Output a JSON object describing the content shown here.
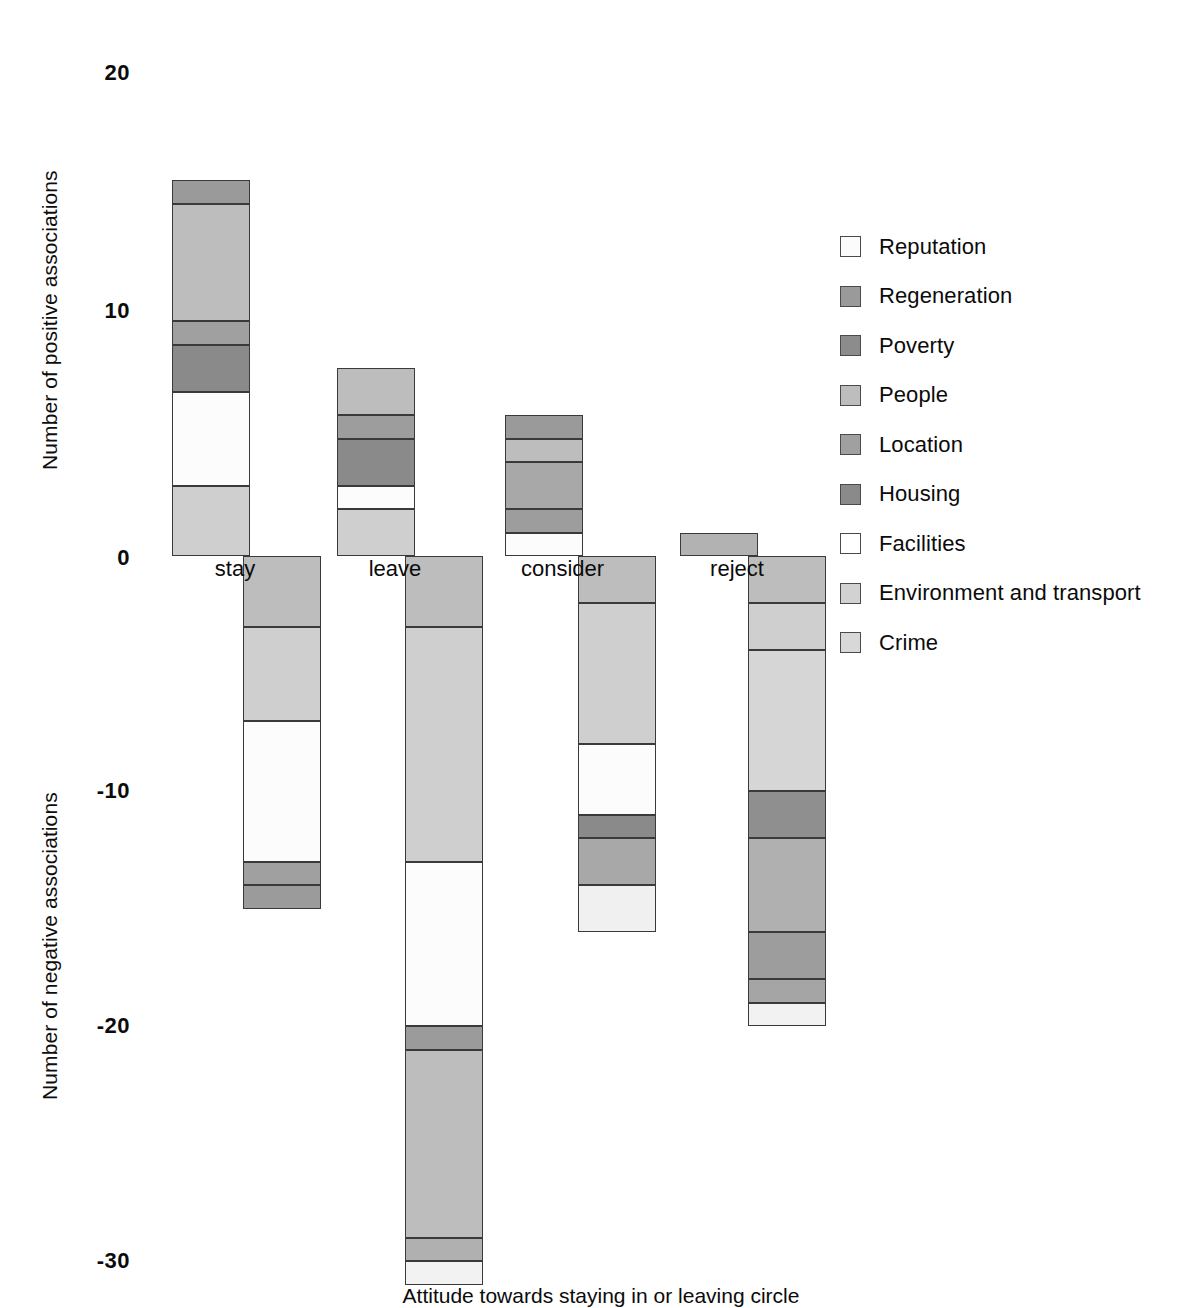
{
  "chart_data": {
    "type": "bar",
    "subtype": "stacked-diverging",
    "title": "",
    "xlabel": "Attitude towards staying in or leaving circle",
    "ylabel_positive": "Number of positive associations",
    "ylabel_negative": "Number of negative associations",
    "categories": [
      "stay",
      "leave",
      "consider",
      "reject"
    ],
    "ylim": [
      -30,
      20
    ],
    "yticks": [
      20,
      10,
      0,
      -10,
      -20,
      -30
    ],
    "ytick_labels": [
      "20",
      "10",
      "0",
      "-10",
      "-20",
      "-30"
    ],
    "grid": false,
    "legend_position": "right",
    "series": [
      {
        "name": "Reputation",
        "color": "#fbfbfb",
        "positive": [
          0,
          0,
          0,
          0
        ],
        "negative": [
          0,
          0,
          0,
          0
        ]
      },
      {
        "name": "Regeneration",
        "color": "#9a9a9a",
        "positive": [
          1,
          0,
          1,
          0
        ],
        "negative": [
          0,
          0,
          0,
          0
        ]
      },
      {
        "name": "Poverty",
        "color": "#8c8c8c",
        "positive": [
          0,
          0,
          0,
          0
        ],
        "negative": [
          0,
          0,
          0,
          0
        ]
      },
      {
        "name": "People",
        "color": "#bdbdbd",
        "positive": [
          5,
          2,
          1,
          1
        ],
        "negative": [
          -3,
          -3,
          -2,
          -2
        ]
      },
      {
        "name": "Location",
        "color": "#a0a0a0",
        "positive": [
          1,
          1,
          2,
          0
        ],
        "negative": [
          -1,
          -1,
          -2,
          -3
        ]
      },
      {
        "name": "Housing",
        "color": "#8a8a8a",
        "positive": [
          2,
          2,
          2,
          0
        ],
        "negative": [
          -1,
          -1,
          -1,
          -2
        ]
      },
      {
        "name": "Facilities",
        "color": "#fcfcfc",
        "positive": [
          4,
          1,
          1,
          0
        ],
        "negative": [
          -6,
          -7,
          -3,
          0
        ]
      },
      {
        "name": "Environment and transport",
        "color": "#cfcfcf",
        "positive": [
          3,
          2,
          0,
          0
        ],
        "negative": [
          -4,
          -10,
          -6,
          -6
        ]
      },
      {
        "name": "Crime",
        "color": "#d8d8d8",
        "positive": [
          0,
          0,
          1,
          0
        ],
        "negative": [
          0,
          -1,
          -2,
          -1
        ]
      }
    ],
    "totals_positive": [
      16,
      8,
      6,
      1
    ],
    "totals_negative": [
      -15,
      -30,
      -16,
      -20
    ],
    "stacks": {
      "stay": {
        "positive": [
          {
            "series": "Environment and transport",
            "from": 0,
            "to": 3,
            "color": "#cfcfcf"
          },
          {
            "series": "Facilities",
            "from": 3,
            "to": 7,
            "color": "#fcfcfc"
          },
          {
            "series": "Housing",
            "from": 7,
            "to": 9,
            "color": "#8a8a8a"
          },
          {
            "series": "Location",
            "from": 9,
            "to": 10,
            "color": "#a0a0a0"
          },
          {
            "series": "People",
            "from": 10,
            "to": 15,
            "color": "#bdbdbd"
          },
          {
            "series": "Regeneration",
            "from": 15,
            "to": 16,
            "color": "#9a9a9a"
          }
        ],
        "negative": [
          {
            "series": "People",
            "from": 0,
            "to": -3,
            "color": "#bdbdbd"
          },
          {
            "series": "Environment and transport",
            "from": -3,
            "to": -7,
            "color": "#cfcfcf"
          },
          {
            "series": "Facilities",
            "from": -7,
            "to": -13,
            "color": "#fcfcfc"
          },
          {
            "series": "Location",
            "from": -13,
            "to": -14,
            "color": "#a0a0a0"
          },
          {
            "series": "Housing",
            "from": -14,
            "to": -15,
            "color": "#9b9b9b"
          }
        ]
      },
      "leave": {
        "positive": [
          {
            "series": "Environment and transport",
            "from": 0,
            "to": 2,
            "color": "#cfcfcf"
          },
          {
            "series": "Facilities",
            "from": 2,
            "to": 3,
            "color": "#fcfcfc"
          },
          {
            "series": "Housing",
            "from": 3,
            "to": 5,
            "color": "#8a8a8a"
          },
          {
            "series": "Location",
            "from": 5,
            "to": 6,
            "color": "#9d9d9d"
          },
          {
            "series": "People",
            "from": 6,
            "to": 8,
            "color": "#bdbdbd"
          }
        ],
        "negative": [
          {
            "series": "People",
            "from": 0,
            "to": -3,
            "color": "#bdbdbd"
          },
          {
            "series": "Environment and transport",
            "from": -3,
            "to": -13,
            "color": "#cfcfcf"
          },
          {
            "series": "Facilities",
            "from": -13,
            "to": -20,
            "color": "#fcfcfc"
          },
          {
            "series": "Location",
            "from": -20,
            "to": -21,
            "color": "#9b9b9b"
          },
          {
            "series": "Housing",
            "from": -21,
            "to": -29,
            "color": "#bdbdbd"
          },
          {
            "series": "Crime",
            "from": -29,
            "to": -30,
            "color": "#b0b0b0"
          },
          {
            "series": "Reputation",
            "from": -30,
            "to": -31,
            "color": "#f2f2f2"
          }
        ]
      },
      "consider": {
        "positive": [
          {
            "series": "Crime",
            "from": 0,
            "to": 1,
            "color": "#fcfcfc"
          },
          {
            "series": "Location",
            "from": 1,
            "to": 2,
            "color": "#9d9d9d"
          },
          {
            "series": "Housing",
            "from": 2,
            "to": 4,
            "color": "#a8a8a8"
          },
          {
            "series": "People",
            "from": 4,
            "to": 5,
            "color": "#bdbdbd"
          },
          {
            "series": "Regeneration",
            "from": 5,
            "to": 6,
            "color": "#9a9a9a"
          }
        ],
        "negative": [
          {
            "series": "People",
            "from": 0,
            "to": -2,
            "color": "#bdbdbd"
          },
          {
            "series": "Environment and transport",
            "from": -2,
            "to": -8,
            "color": "#cfcfcf"
          },
          {
            "series": "Facilities",
            "from": -8,
            "to": -11,
            "color": "#fcfcfc"
          },
          {
            "series": "Location",
            "from": -11,
            "to": -12,
            "color": "#8a8a8a"
          },
          {
            "series": "Housing",
            "from": -12,
            "to": -14,
            "color": "#a8a8a8"
          },
          {
            "series": "Crime",
            "from": -14,
            "to": -16,
            "color": "#f0f0f0"
          }
        ]
      },
      "reject": {
        "positive": [
          {
            "series": "People",
            "from": 0,
            "to": 1,
            "color": "#b2b2b2"
          }
        ],
        "negative": [
          {
            "series": "People",
            "from": 0,
            "to": -2,
            "color": "#bdbdbd"
          },
          {
            "series": "Environment and transport",
            "from": -2,
            "to": -4,
            "color": "#cfcfcf"
          },
          {
            "series": "Crime",
            "from": -4,
            "to": -10,
            "color": "#d6d6d6"
          },
          {
            "series": "Location",
            "from": -10,
            "to": -12,
            "color": "#8f8f8f"
          },
          {
            "series": "Housing",
            "from": -12,
            "to": -16,
            "color": "#b0b0b0"
          },
          {
            "series": "Poverty",
            "from": -16,
            "to": -18,
            "color": "#9d9d9d"
          },
          {
            "series": "Regeneration",
            "from": -18,
            "to": -19,
            "color": "#a5a5a5"
          },
          {
            "series": "Reputation",
            "from": -19,
            "to": -20,
            "color": "#f2f2f2"
          }
        ]
      }
    }
  },
  "axes": {
    "positive_title": "Number of positive associations",
    "negative_title": "Number of negative associations",
    "tick_20": "20",
    "tick_10": "10",
    "tick_0": "0",
    "tick_m10": "-10",
    "tick_m20": "-20",
    "tick_m30": "-30",
    "x_title": "Attitude towards staying in or leaving circle"
  },
  "category_labels": {
    "stay": "stay",
    "leave": "leave",
    "consider": "consider",
    "reject": "reject"
  },
  "legend": {
    "items": [
      {
        "label": "Reputation",
        "color": "#fbfbfb"
      },
      {
        "label": "Regeneration",
        "color": "#9a9a9a"
      },
      {
        "label": "Poverty",
        "color": "#8c8c8c"
      },
      {
        "label": "People",
        "color": "#bdbdbd"
      },
      {
        "label": "Location",
        "color": "#a0a0a0"
      },
      {
        "label": "Housing",
        "color": "#8a8a8a"
      },
      {
        "label": "Facilities",
        "color": "#ffffff"
      },
      {
        "label": "Environment and transport",
        "color": "#d2d2d2"
      },
      {
        "label": "Crime",
        "color": "#d8d8d8"
      }
    ]
  }
}
